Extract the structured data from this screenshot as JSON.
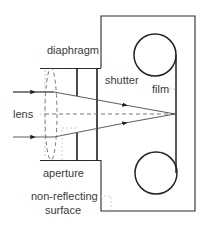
{
  "diagram": {
    "labels": {
      "diaphragm": "diaphragm",
      "shutter": "shutter",
      "film": "film",
      "lens": "lens",
      "aperture": "aperture",
      "non_reflecting_line1": "non-reflecting",
      "non_reflecting_line2": "surface"
    }
  }
}
